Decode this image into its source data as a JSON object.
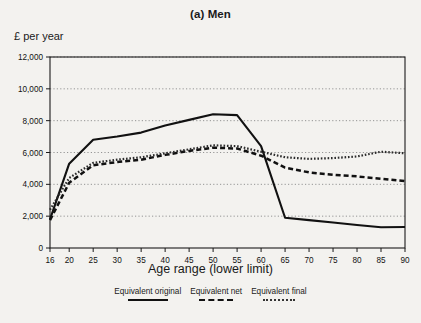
{
  "figure": {
    "title": "(a) Men",
    "y_axis_label": "£ per year",
    "x_axis_title": "Age range (lower limit)",
    "background_color": "#f3f2ef",
    "line_color": "#111111"
  },
  "legend": {
    "position": "bottom",
    "items": [
      {
        "label": "Equivalent original",
        "style": "solid"
      },
      {
        "label": "Equivalent net",
        "style": "dashed"
      },
      {
        "label": "Equivalent final",
        "style": "dotted"
      }
    ]
  },
  "chart_data": {
    "type": "line",
    "title": "(a) Men",
    "xlabel": "Age range (lower limit)",
    "ylabel": "£ per year",
    "grid": true,
    "legend_position": "bottom",
    "xlim": [
      16,
      90
    ],
    "ylim": [
      0,
      12000
    ],
    "ytick_labels": [
      "12,000",
      "10,000",
      "8,000",
      "6,000",
      "4,000",
      "2,000",
      "0"
    ],
    "ytick_values": [
      12000,
      10000,
      8000,
      6000,
      4000,
      2000,
      0
    ],
    "xtick_labels": [
      "16",
      "20",
      "25",
      "30",
      "35",
      "40",
      "45",
      "50",
      "55",
      "60",
      "65",
      "70",
      "75",
      "80",
      "85",
      "90"
    ],
    "x": [
      16,
      20,
      25,
      30,
      35,
      40,
      45,
      50,
      55,
      60,
      65,
      70,
      75,
      80,
      85,
      90
    ],
    "series": [
      {
        "name": "Equivalent original",
        "style": "solid",
        "values": [
          1800,
          5300,
          6800,
          7000,
          7250,
          7700,
          8050,
          8400,
          8350,
          6400,
          1900,
          1750,
          1600,
          1450,
          1300,
          1320
        ]
      },
      {
        "name": "Equivalent net",
        "style": "dashed",
        "values": [
          1750,
          4100,
          5200,
          5400,
          5550,
          5850,
          6100,
          6300,
          6250,
          5800,
          5050,
          4750,
          4600,
          4500,
          4350,
          4200
        ]
      },
      {
        "name": "Equivalent final",
        "style": "dotted",
        "values": [
          2400,
          4400,
          5350,
          5550,
          5700,
          5950,
          6200,
          6450,
          6400,
          6050,
          5700,
          5600,
          5650,
          5750,
          6050,
          5950
        ]
      }
    ]
  }
}
